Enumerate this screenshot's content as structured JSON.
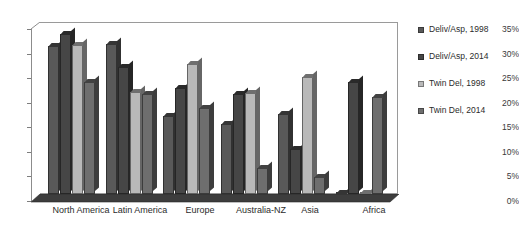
{
  "chart_data": {
    "type": "bar",
    "title": "",
    "subtitle": "",
    "xlabel": "",
    "ylabel": "",
    "ylim": [
      0,
      35
    ],
    "ytick_labels": [
      "0%",
      "5%",
      "10%",
      "15%",
      "20%",
      "25%",
      "30%",
      "35%"
    ],
    "ytick_values": [
      0,
      5,
      10,
      15,
      20,
      25,
      30,
      35
    ],
    "grid": false,
    "legend_position": "right",
    "style": "3d-clustered-column",
    "categories": [
      "North America",
      "Latin America",
      "Europe",
      "Australia-NZ",
      "Asia",
      "Africa"
    ],
    "series": [
      {
        "name": "Deliv/Asp, 1998",
        "color": "#595959",
        "values": [
          30.2,
          30.5,
          15.8,
          14.3,
          16.3,
          0.3
        ]
      },
      {
        "name": "Deliv/Asp, 2014",
        "color": "#464646",
        "values": [
          32.6,
          25.8,
          21.6,
          20.3,
          9.2,
          22.8
        ]
      },
      {
        "name": "Twin Del, 1998",
        "color": "#b9b9b9",
        "values": [
          30.4,
          20.8,
          26.5,
          20.5,
          23.8,
          0.3
        ]
      },
      {
        "name": "Twin Del, 2014",
        "color": "#6e6e6e",
        "values": [
          22.8,
          20.4,
          17.6,
          5.2,
          3.4,
          19.7
        ]
      }
    ]
  },
  "legend": {
    "items": [
      {
        "label": "Deliv/Asp, 1998",
        "color": "#595959"
      },
      {
        "label": "Deliv/Asp, 2014",
        "color": "#464646"
      },
      {
        "label": "Twin Del, 1998",
        "color": "#b9b9b9"
      },
      {
        "label": "Twin Del, 2014",
        "color": "#6e6e6e"
      }
    ]
  }
}
